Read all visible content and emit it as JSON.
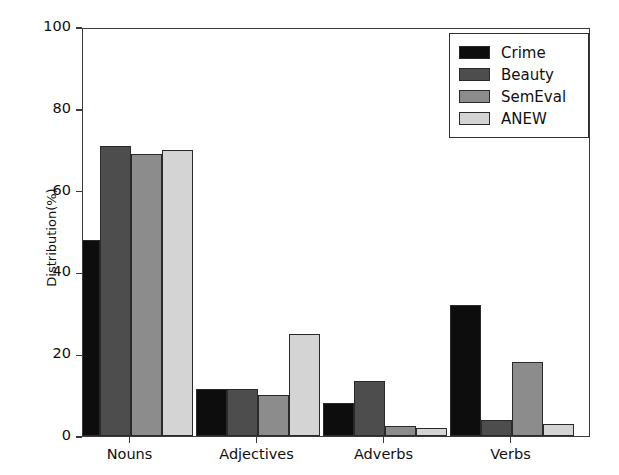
{
  "chart_data": {
    "type": "bar",
    "title": "",
    "xlabel": "",
    "ylabel": "Distribution(%)",
    "categories": [
      "Nouns",
      "Adjectives",
      "Adverbs",
      "Verbs"
    ],
    "series": [
      {
        "name": "Crime",
        "color": "#0d0d0d",
        "values": [
          48,
          11.5,
          8,
          32
        ]
      },
      {
        "name": "Beauty",
        "color": "#4d4d4d",
        "values": [
          71,
          11.5,
          13.5,
          4
        ]
      },
      {
        "name": "SemEval",
        "color": "#8c8c8c",
        "values": [
          69,
          10,
          2.5,
          18
        ]
      },
      {
        "name": "ANEW",
        "color": "#d4d4d4",
        "values": [
          70,
          25,
          2,
          3
        ]
      }
    ],
    "ylim": [
      0,
      100
    ],
    "yticks": [
      0,
      20,
      40,
      60,
      80,
      100
    ],
    "ytick_labels": [
      "0",
      "20",
      "40",
      "60",
      "80",
      "100"
    ],
    "grid": false,
    "legend_position": "upper right",
    "legend_entries": [
      "Crime",
      "Beauty",
      "SemEval",
      "ANEW"
    ]
  },
  "axes": {
    "y_axis_label": "Distribution(%)"
  }
}
